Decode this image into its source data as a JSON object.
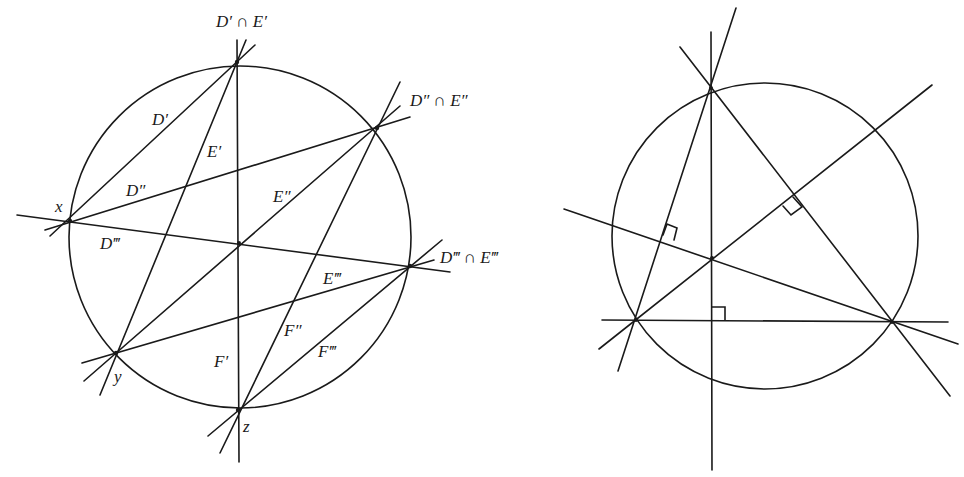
{
  "figures": [
    {
      "id": "left",
      "description": "Circle with six points and three families of chords D, E, F meeting at intersection points",
      "labels": {
        "top": "D′ ∩ E′",
        "upper_right": "D″ ∩ E″",
        "right": "D‴ ∩ E‴",
        "x": "x",
        "y": "y",
        "z": "z",
        "D1": "D′",
        "D2": "D″",
        "D3": "D‴",
        "E1": "E′",
        "E2": "E″",
        "E3": "E‴",
        "F1": "F′",
        "F2": "F″",
        "F3": "F‴"
      }
    },
    {
      "id": "right",
      "description": "Triangle inscribed in circle with three altitudes meeting at orthocenter; right-angle marks at feet of altitudes",
      "labels": {}
    }
  ]
}
